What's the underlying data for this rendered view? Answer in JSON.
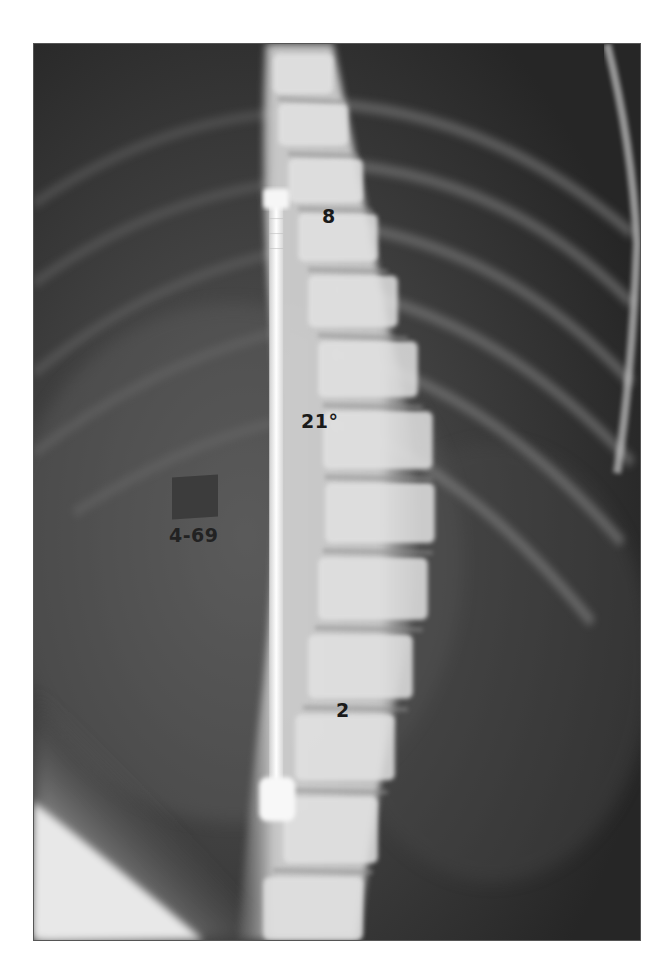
{
  "figure": {
    "type": "radiograph",
    "view": "frontal spine with corrective rod",
    "annotations": {
      "upper_curve": "8",
      "middle_curve": "21°",
      "lower_curve": "2",
      "date_marker": "4-69"
    },
    "colors": {
      "film_dark": "#2a2a2a",
      "bone": "#e6e6e6",
      "rod": "#f4f4f4",
      "label_text": "#1a1a1a",
      "border": "#555555"
    }
  }
}
